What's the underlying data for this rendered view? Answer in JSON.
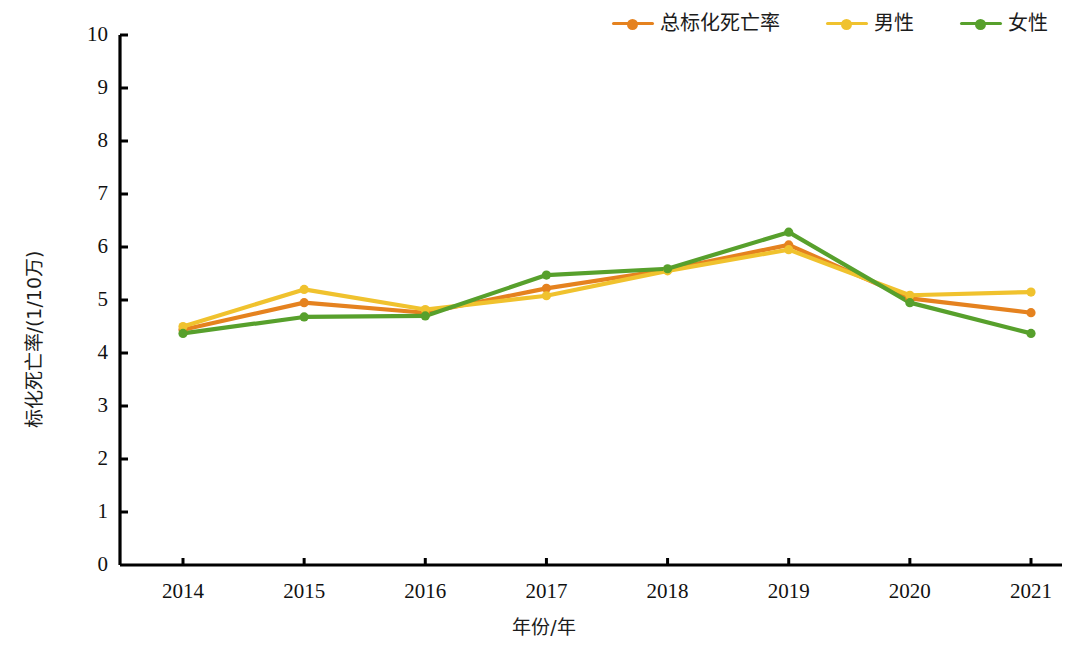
{
  "chart_data": {
    "type": "line",
    "title": "",
    "xlabel": "年份/年",
    "ylabel": "标化死亡率/(1/10万)",
    "categories": [
      "2014",
      "2015",
      "2016",
      "2017",
      "2018",
      "2019",
      "2020",
      "2021"
    ],
    "x": [
      2014,
      2015,
      2016,
      2017,
      2018,
      2019,
      2020,
      2021
    ],
    "ylim": [
      0,
      10
    ],
    "xlim": [
      2013.5,
      2021.5
    ],
    "yticks": [
      "0",
      "1",
      "2",
      "3",
      "4",
      "5",
      "6",
      "7",
      "8",
      "9",
      "10"
    ],
    "ytick_step": 1,
    "grid": false,
    "legend_position": "top-right",
    "series": [
      {
        "name": "总标化死亡率",
        "color": "#E5821F",
        "marker": "circle",
        "values": [
          4.44,
          4.95,
          4.76,
          5.22,
          5.57,
          6.04,
          5.03,
          4.76
        ]
      },
      {
        "name": "男性",
        "color": "#F0C22E",
        "marker": "circle",
        "values": [
          4.5,
          5.2,
          4.82,
          5.08,
          5.55,
          5.95,
          5.09,
          5.15
        ]
      },
      {
        "name": "女性",
        "color": "#57A02C",
        "marker": "circle",
        "values": [
          4.37,
          4.68,
          4.7,
          5.47,
          5.59,
          6.28,
          4.95,
          4.37
        ]
      }
    ]
  },
  "legend": {
    "entries": [
      {
        "label": "总标化死亡率",
        "color": "#E5821F"
      },
      {
        "label": "男性",
        "color": "#F0C22E"
      },
      {
        "label": "女性",
        "color": "#57A02C"
      }
    ]
  },
  "axes": {
    "y_title": "标化死亡率/(1/10万)",
    "x_title": "年份/年",
    "y_tick_labels": [
      "10",
      "9",
      "8",
      "7",
      "6",
      "5",
      "4",
      "3",
      "2",
      "1",
      "0"
    ],
    "x_tick_labels": [
      "2014",
      "2015",
      "2016",
      "2017",
      "2018",
      "2019",
      "2020",
      "2021"
    ]
  }
}
